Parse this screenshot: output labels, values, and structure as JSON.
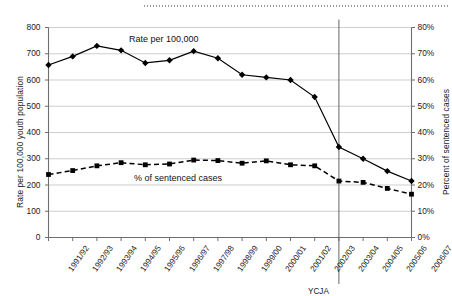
{
  "chart_data": {
    "type": "line",
    "title": "",
    "xlabel": "",
    "categories": [
      "1991/92",
      "1992/93",
      "1993/94",
      "1994/95",
      "1995/96",
      "1996/97",
      "1997/98",
      "1998/99",
      "1999/00",
      "2000/01",
      "2001/02",
      "2002/03",
      "2003/04",
      "2004/05",
      "2005/06",
      "2006/07"
    ],
    "grid": true,
    "legend_position": "inline-annotation",
    "series": [
      {
        "name": "Rate per 100,000",
        "axis": "left",
        "style": "solid",
        "marker": "diamond",
        "color": "#000000",
        "values": [
          657,
          690,
          730,
          713,
          665,
          675,
          710,
          683,
          620,
          610,
          600,
          535,
          345,
          300,
          253,
          215
        ]
      },
      {
        "name": "% of sentenced cases",
        "axis": "right",
        "style": "dashed",
        "marker": "square",
        "color": "#000000",
        "values": [
          24.0,
          25.5,
          27.3,
          28.5,
          27.7,
          28.0,
          29.5,
          29.3,
          28.3,
          29.2,
          27.7,
          27.3,
          21.5,
          21.0,
          18.7,
          16.5
        ]
      }
    ],
    "y_left": {
      "label": "Rate per 100,000 youth population",
      "ticks": [
        "0",
        "100",
        "200",
        "300",
        "400",
        "500",
        "600",
        "700",
        "800"
      ],
      "values": [
        0,
        100,
        200,
        300,
        400,
        500,
        600,
        700,
        800
      ],
      "ylim": [
        0,
        800
      ]
    },
    "y_right": {
      "label": "Percent of sentenced cases",
      "ticks": [
        "0%",
        "10%",
        "20%",
        "30%",
        "40%",
        "50%",
        "60%",
        "70%",
        "80%"
      ],
      "values": [
        0,
        10,
        20,
        30,
        40,
        50,
        60,
        70,
        80
      ],
      "ylim": [
        0,
        80
      ]
    },
    "annotations": [
      {
        "name": "ycja-marker",
        "label": "YCJA",
        "at_category": "2003/04"
      }
    ],
    "series_labels": {
      "rate": "Rate per 100,000",
      "percent": "% of sentenced cases"
    }
  }
}
